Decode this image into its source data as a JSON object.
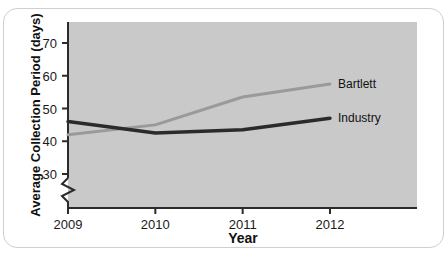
{
  "figure": {
    "background_color": "#ffffff",
    "frame_color": "#cfcfcf",
    "plot_background_color": "#c9c9c9"
  },
  "chart_data": {
    "type": "line",
    "title": "",
    "xlabel": "Year",
    "ylabel": "Average Collection Period (days)",
    "x": [
      2009,
      2010,
      2011,
      2012
    ],
    "xtick_labels": [
      "2009",
      "2010",
      "2011",
      "2012"
    ],
    "ytick_labels": [
      "30",
      "40",
      "50",
      "60",
      "70"
    ],
    "ytick_values": [
      30,
      40,
      50,
      60,
      70
    ],
    "ylim": [
      27,
      74
    ],
    "xlim": [
      2009,
      2012
    ],
    "y_axis_break": true,
    "grid": false,
    "legend_position": "right-inline",
    "series": [
      {
        "name": "Bartlett",
        "label": "Bartlett",
        "color": "#9a9a9a",
        "line_width": 3,
        "values": [
          42,
          45,
          53.5,
          57.5
        ]
      },
      {
        "name": "Industry",
        "label": "Industry",
        "color": "#2b2b2b",
        "line_width": 3.5,
        "values": [
          46,
          42.5,
          43.5,
          47
        ]
      }
    ]
  }
}
